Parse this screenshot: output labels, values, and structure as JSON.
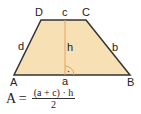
{
  "diagram": {
    "vertices": {
      "A": "A",
      "B": "B",
      "C": "C",
      "D": "D"
    },
    "sides": {
      "a": "a",
      "b": "b",
      "c": "c",
      "d": "d"
    },
    "height_label": "h",
    "formula": {
      "lhs": "A =",
      "numerator": "(a + c) · h",
      "denominator": "2"
    },
    "colors": {
      "fill": "#f7e0b4",
      "edge": "#333333",
      "height": "#e8a060"
    }
  }
}
